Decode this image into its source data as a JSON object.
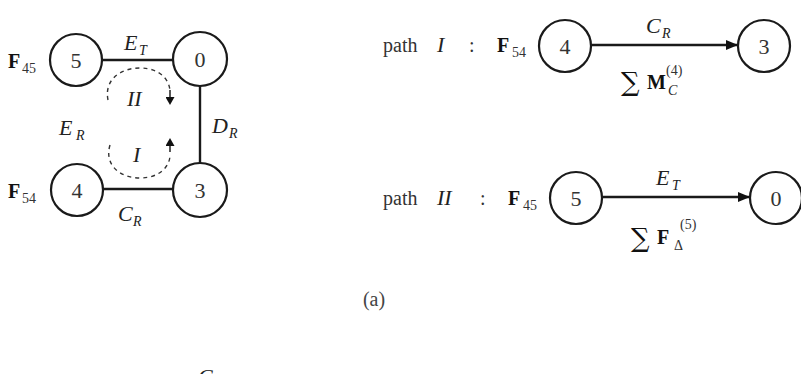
{
  "diagram": {
    "colors": {
      "stroke": "#1a1a1a",
      "text": "#333333",
      "background": "#ffffff"
    },
    "loop_graph": {
      "nodes": [
        {
          "id": "5",
          "label": "5",
          "force_label": "F",
          "force_sub": "45"
        },
        {
          "id": "0",
          "label": "0"
        },
        {
          "id": "4",
          "label": "4",
          "force_label": "F",
          "force_sub": "54"
        },
        {
          "id": "3",
          "label": "3"
        }
      ],
      "edges": [
        {
          "from": "5",
          "to": "0",
          "label": "E",
          "sub": "T"
        },
        {
          "from": "0",
          "to": "3",
          "label": "D",
          "sub": "R"
        },
        {
          "from": "4",
          "to": "3",
          "label": "C",
          "sub": "R"
        },
        {
          "from": "5",
          "to": "4",
          "label": "E",
          "sub": "R",
          "drawn": false
        }
      ],
      "loops": [
        {
          "label": "II",
          "direction": "clockwise"
        },
        {
          "label": "I",
          "direction": "counterclockwise"
        }
      ]
    },
    "paths": [
      {
        "prefix": "path",
        "name": "I",
        "separator": ":",
        "force_label": "F",
        "force_sub": "54",
        "from_node": "4",
        "to_node": "3",
        "edge_label": "C",
        "edge_sub": "R",
        "sum_symbol": "∑",
        "sum_term": "M",
        "sum_sub": "C",
        "sum_sup": "(4)"
      },
      {
        "prefix": "path",
        "name": "II",
        "separator": ":",
        "force_label": "F",
        "force_sub": "45",
        "from_node": "5",
        "to_node": "0",
        "edge_label": "E",
        "edge_sub": "T",
        "sum_symbol": "∑",
        "sum_term": "F",
        "sum_sub": "Δ",
        "sum_sup": "(5)"
      }
    ],
    "caption": "(a)",
    "partial_next_label": "C"
  }
}
